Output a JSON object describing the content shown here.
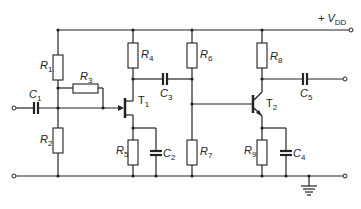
{
  "diagram": {
    "type": "circuit-schematic",
    "supply_label": {
      "main": "+ V",
      "sub": "DD"
    },
    "components": {
      "R1": {
        "main": "R",
        "sub": "1"
      },
      "R2": {
        "main": "R",
        "sub": "2"
      },
      "R3": {
        "main": "R",
        "sub": "3"
      },
      "R4": {
        "main": "R",
        "sub": "4"
      },
      "R5": {
        "main": "R",
        "sub": "5"
      },
      "R6": {
        "main": "R",
        "sub": "6"
      },
      "R7": {
        "main": "R",
        "sub": "7"
      },
      "R8": {
        "main": "R",
        "sub": "8"
      },
      "R9": {
        "main": "R",
        "sub": "9"
      },
      "C1": {
        "main": "C",
        "sub": "1"
      },
      "C2": {
        "main": "C",
        "sub": "2"
      },
      "C3": {
        "main": "C",
        "sub": "3"
      },
      "C4": {
        "main": "C",
        "sub": "4"
      },
      "C5": {
        "main": "C",
        "sub": "5"
      },
      "T1": {
        "main": "T",
        "sub": "1"
      },
      "T2": {
        "main": "T",
        "sub": "2"
      }
    }
  }
}
